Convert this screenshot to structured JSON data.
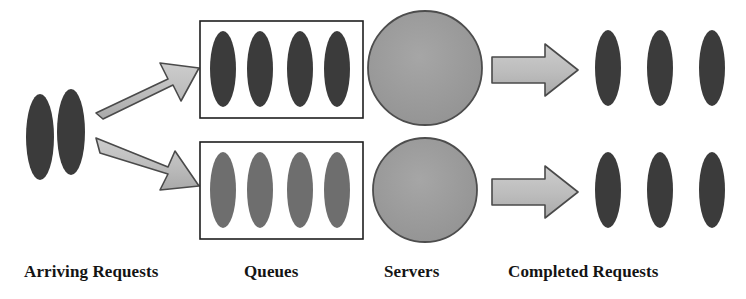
{
  "diagram": {
    "width": 746,
    "height": 299,
    "background": "#ffffff"
  },
  "colors": {
    "request_dark": "#3b3b3b",
    "request_mid": "#6e6e6e",
    "server_fill": "#9a9a9a",
    "arrow_fill": "#b9b9b9",
    "arrow_fill_light": "#cfcfcf",
    "outline": "#2b2b2b",
    "box_border": "#1f1f1f",
    "box_fill": "#ffffff",
    "text": "#141414"
  },
  "labels": {
    "arriving": "Arriving Requests",
    "queues": "Queues",
    "servers": "Servers",
    "completed": "Completed Requests"
  },
  "stages": {
    "arriving_requests": {
      "name": "Arriving Requests",
      "count": 2,
      "shape": "ellipse",
      "fill": "#3b3b3b",
      "items": [
        {
          "cx": 40,
          "cy": 137,
          "rx": 14,
          "ry": 43
        },
        {
          "cx": 71,
          "cy": 132,
          "rx": 14,
          "ry": 43
        }
      ]
    },
    "inlet_arrows": {
      "name": "Inlet Arrows",
      "count": 2,
      "shape": "block-arrow",
      "fill": "#b9b9b9",
      "directions": [
        "up-right",
        "down-right"
      ]
    },
    "queues": {
      "name": "Queues",
      "count": 2,
      "jobs_per_queue": 4,
      "boxes": [
        {
          "id": "queue-top",
          "x": 200,
          "y": 21,
          "w": 163,
          "h": 97,
          "fill_shade": "#3b3b3b"
        },
        {
          "id": "queue-bottom",
          "x": 200,
          "y": 142,
          "w": 163,
          "h": 97,
          "fill_shade": "#6e6e6e"
        }
      ]
    },
    "servers": {
      "name": "Servers",
      "count": 2,
      "shape": "circle",
      "fill": "#9a9a9a",
      "items": [
        {
          "cx": 425,
          "cy": 68,
          "r": 57
        },
        {
          "cx": 425,
          "cy": 190,
          "r": 52
        }
      ]
    },
    "outlet_arrows": {
      "name": "Outlet Arrows",
      "count": 2,
      "shape": "block-arrow",
      "fill": "#b9b9b9",
      "directions": [
        "right",
        "right"
      ]
    },
    "completed_requests": {
      "name": "Completed Requests",
      "count": 6,
      "rows": 2,
      "per_row": 3,
      "shape": "ellipse",
      "fill": "#3b3b3b",
      "top_row": [
        {
          "cx": 608,
          "cy": 68
        },
        {
          "cx": 660,
          "cy": 68
        },
        {
          "cx": 712,
          "cy": 68
        }
      ],
      "bottom_row": [
        {
          "cx": 608,
          "cy": 190
        },
        {
          "cx": 660,
          "cy": 190
        },
        {
          "cx": 712,
          "cy": 190
        }
      ]
    }
  }
}
